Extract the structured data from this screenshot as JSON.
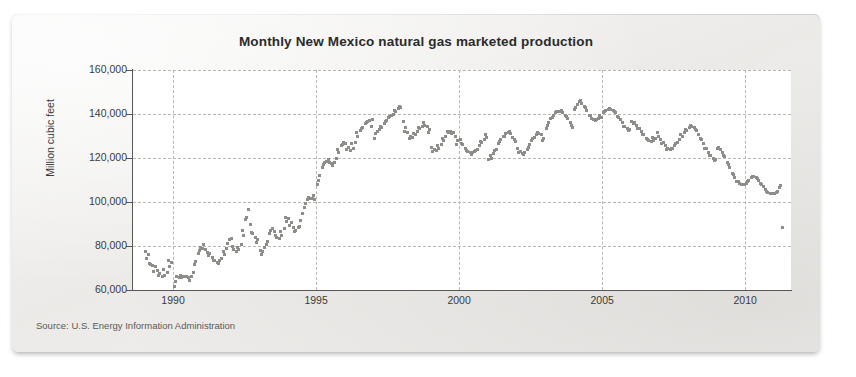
{
  "card": {
    "title": "Monthly New Mexico natural gas marketed production",
    "source_note": "Source: U.S. Energy Information Administration"
  },
  "colors": {
    "marker": "#8e8d8a",
    "axis": "#595754",
    "grid": "#b9b7b4",
    "plot_background": "#ffffff",
    "card_background": "#f1f0ee",
    "title_text": "#2b2b2b"
  },
  "chart_data": {
    "type": "scatter",
    "title": "Monthly New Mexico natural gas marketed production",
    "xlabel": "",
    "ylabel": "Million cubic feet",
    "xlim": [
      1988.6,
      2011.6
    ],
    "ylim": [
      60000,
      160000
    ],
    "grid": true,
    "legend": null,
    "ytick_labels": [
      "160,000",
      "140,000",
      "120,000",
      "100,000",
      "80,000",
      "60,000"
    ],
    "ytick_values": [
      160000,
      140000,
      120000,
      100000,
      80000,
      60000
    ],
    "xtick_labels": [
      "1990",
      "1995",
      "2000",
      "2005",
      "2010"
    ],
    "xtick_values": [
      1990,
      1995,
      2000,
      2005,
      2010
    ],
    "series": [
      {
        "name": "New Mexico marketed production",
        "marker": "square",
        "x": [
          1989.04,
          1989.13,
          1989.21,
          1989.29,
          1989.38,
          1989.46,
          1989.54,
          1989.63,
          1989.71,
          1989.79,
          1989.88,
          1989.96,
          1990.04,
          1990.13,
          1990.21,
          1990.29,
          1990.38,
          1990.46,
          1990.54,
          1990.63,
          1990.71,
          1990.79,
          1990.88,
          1990.96,
          1991.04,
          1991.13,
          1991.21,
          1991.29,
          1991.38,
          1991.46,
          1991.54,
          1991.63,
          1991.71,
          1991.79,
          1991.88,
          1991.96,
          1992.04,
          1992.13,
          1992.21,
          1992.29,
          1992.38,
          1992.46,
          1992.54,
          1992.63,
          1992.71,
          1992.79,
          1992.88,
          1992.96,
          1993.04,
          1993.13,
          1993.21,
          1993.29,
          1993.38,
          1993.46,
          1993.54,
          1993.63,
          1993.71,
          1993.79,
          1993.88,
          1993.96,
          1994.04,
          1994.13,
          1994.21,
          1994.29,
          1994.38,
          1994.46,
          1994.54,
          1994.63,
          1994.71,
          1994.79,
          1994.88,
          1994.96,
          1995.04,
          1995.13,
          1995.21,
          1995.29,
          1995.38,
          1995.46,
          1995.54,
          1995.63,
          1995.71,
          1995.79,
          1995.88,
          1995.96,
          1996.04,
          1996.13,
          1996.21,
          1996.29,
          1996.38,
          1996.46,
          1996.54,
          1996.63,
          1996.71,
          1996.79,
          1996.88,
          1996.96,
          1997.04,
          1997.13,
          1997.21,
          1997.29,
          1997.38,
          1997.46,
          1997.54,
          1997.63,
          1997.71,
          1997.79,
          1997.88,
          1997.96,
          1998.04,
          1998.13,
          1998.21,
          1998.29,
          1998.38,
          1998.46,
          1998.54,
          1998.63,
          1998.71,
          1998.79,
          1998.88,
          1998.96,
          1999.04,
          1999.13,
          1999.21,
          1999.29,
          1999.38,
          1999.46,
          1999.54,
          1999.63,
          1999.71,
          1999.79,
          1999.88,
          1999.96,
          2000.04,
          2000.13,
          2000.21,
          2000.29,
          2000.38,
          2000.46,
          2000.54,
          2000.63,
          2000.71,
          2000.79,
          2000.88,
          2000.96,
          2001.04,
          2001.13,
          2001.21,
          2001.29,
          2001.38,
          2001.46,
          2001.54,
          2001.63,
          2001.71,
          2001.79,
          2001.88,
          2001.96,
          2002.04,
          2002.13,
          2002.21,
          2002.29,
          2002.38,
          2002.46,
          2002.54,
          2002.63,
          2002.71,
          2002.79,
          2002.88,
          2002.96,
          2003.04,
          2003.13,
          2003.21,
          2003.29,
          2003.38,
          2003.46,
          2003.54,
          2003.63,
          2003.71,
          2003.79,
          2003.88,
          2003.96,
          2004.04,
          2004.13,
          2004.21,
          2004.29,
          2004.38,
          2004.46,
          2004.54,
          2004.63,
          2004.71,
          2004.79,
          2004.88,
          2004.96,
          2005.04,
          2005.13,
          2005.21,
          2005.29,
          2005.38,
          2005.46,
          2005.54,
          2005.63,
          2005.71,
          2005.79,
          2005.88,
          2005.96,
          2006.04,
          2006.13,
          2006.21,
          2006.29,
          2006.38,
          2006.46,
          2006.54,
          2006.63,
          2006.71,
          2006.79,
          2006.88,
          2006.96,
          2007.04,
          2007.13,
          2007.21,
          2007.29,
          2007.38,
          2007.46,
          2007.54,
          2007.63,
          2007.71,
          2007.79,
          2007.88,
          2007.96,
          2008.04,
          2008.13,
          2008.21,
          2008.29,
          2008.38,
          2008.46,
          2008.54,
          2008.63,
          2008.71,
          2008.79,
          2008.88,
          2008.96,
          2009.04,
          2009.13,
          2009.21,
          2009.29,
          2009.38,
          2009.46,
          2009.54,
          2009.63,
          2009.71,
          2009.79,
          2009.88,
          2009.96,
          2010.04,
          2010.13,
          2010.21,
          2010.29,
          2010.38,
          2010.46,
          2010.54,
          2010.63,
          2010.71,
          2010.79,
          2010.88,
          2010.96,
          2011.04,
          2011.13,
          2011.21,
          2011.29
        ],
        "y": [
          77500,
          76200,
          71500,
          71000,
          70500,
          69000,
          67500,
          66000,
          66500,
          68000,
          70500,
          72500,
          61500,
          66000,
          65500,
          65800,
          66200,
          66000,
          65500,
          66000,
          68000,
          73000,
          76500,
          79500,
          79000,
          78200,
          77000,
          76500,
          74800,
          73200,
          72500,
          73500,
          74500,
          76000,
          79000,
          83000,
          83500,
          78500,
          77500,
          78500,
          80500,
          85000,
          92000,
          96500,
          90000,
          85500,
          84000,
          83000,
          78000,
          77500,
          79500,
          82000,
          85500,
          88000,
          86500,
          84000,
          83500,
          85000,
          88000,
          91000,
          92500,
          90500,
          88500,
          87000,
          88500,
          91500,
          95000,
          99500,
          101000,
          101500,
          101500,
          101000,
          108000,
          112000,
          115500,
          118000,
          118500,
          118000,
          117500,
          118000,
          120000,
          122500,
          125500,
          127000,
          126500,
          125000,
          123500,
          124500,
          127000,
          130000,
          132500,
          134000,
          135500,
          136500,
          137000,
          137500,
          129000,
          132000,
          133000,
          134000,
          135500,
          137000,
          138500,
          139500,
          140000,
          141000,
          142500,
          143000,
          136500,
          134000,
          131500,
          130000,
          129500,
          130500,
          132000,
          133500,
          134500,
          135000,
          134500,
          133000,
          125000,
          124000,
          123500,
          124500,
          126000,
          128000,
          130000,
          131500,
          132000,
          131500,
          130000,
          128000,
          128500,
          126000,
          124500,
          123000,
          122500,
          122500,
          123000,
          124000,
          125500,
          127000,
          128500,
          129500,
          119500,
          120000,
          122000,
          124000,
          126500,
          128500,
          130000,
          131000,
          131500,
          131000,
          129500,
          127500,
          124500,
          123000,
          122000,
          122500,
          124000,
          126000,
          128000,
          129500,
          130500,
          131000,
          130500,
          129000,
          133500,
          136000,
          138000,
          139500,
          140500,
          141000,
          141000,
          140500,
          139500,
          138000,
          136000,
          134000,
          142000,
          144500,
          145500,
          145000,
          143500,
          141500,
          139500,
          138000,
          137500,
          137500,
          138000,
          138500,
          140500,
          141500,
          142000,
          142000,
          141500,
          140500,
          139000,
          137500,
          136000,
          134500,
          133500,
          133000,
          136500,
          136000,
          135000,
          133500,
          132000,
          130500,
          129000,
          128000,
          127500,
          128000,
          129000,
          130000,
          128500,
          127000,
          125500,
          124500,
          124000,
          124500,
          125500,
          127000,
          128500,
          130000,
          131500,
          132500,
          134000,
          134500,
          134000,
          132500,
          130500,
          128500,
          126500,
          124500,
          122500,
          121000,
          120000,
          119500,
          124500,
          124000,
          122500,
          120500,
          118000,
          115500,
          113000,
          111000,
          109500,
          108500,
          108000,
          108000,
          108500,
          110000,
          111000,
          111500,
          111000,
          110000,
          108500,
          107000,
          105500,
          104500,
          104000,
          104000,
          104000,
          105000,
          106500,
          88500
        ]
      }
    ],
    "scatter_extra_points": {
      "note": "dispersion points giving the cloud its monthly spread",
      "x": [
        1989.08,
        1989.17,
        1989.33,
        1989.5,
        1989.67,
        1989.83,
        1990.08,
        1990.25,
        1990.42,
        1990.58,
        1990.75,
        1990.92,
        1991.08,
        1991.25,
        1991.42,
        1991.58,
        1991.75,
        1991.92,
        1992.08,
        1992.25,
        1992.42,
        1992.58,
        1992.75,
        1992.92,
        1993.08,
        1993.25,
        1993.42,
        1993.58,
        1993.75,
        1993.92,
        1994.08,
        1994.25,
        1994.42,
        1994.58,
        1994.75,
        1994.92,
        1995.08,
        1995.25,
        1995.42,
        1995.58,
        1995.75,
        1995.92,
        1996.08,
        1996.25,
        1996.42,
        1996.58,
        1996.75,
        1996.92,
        1997.08,
        1997.25,
        1997.42,
        1997.58,
        1997.75,
        1997.92,
        1998.08,
        1998.25,
        1998.42,
        1998.58,
        1998.75,
        1998.92,
        1999.08,
        1999.25,
        1999.42,
        1999.58,
        1999.75,
        1999.92,
        2000.08,
        2000.25,
        2000.42,
        2000.58,
        2000.75,
        2000.92,
        2001.08,
        2001.25,
        2001.42,
        2001.58,
        2001.75,
        2001.92,
        2002.08,
        2002.25,
        2002.42,
        2002.58,
        2002.75,
        2002.92,
        2003.08,
        2003.25,
        2003.42,
        2003.58,
        2003.75,
        2003.92,
        2004.08,
        2004.25,
        2004.42,
        2004.58,
        2004.75,
        2004.92,
        2005.08,
        2005.25,
        2005.42,
        2005.58,
        2005.75,
        2005.92,
        2006.08,
        2006.25,
        2006.42,
        2006.58,
        2006.75,
        2006.92,
        2007.08,
        2007.25,
        2007.42,
        2007.58,
        2007.75,
        2007.92,
        2008.08,
        2008.25,
        2008.42,
        2008.58,
        2008.75,
        2008.92,
        2009.08,
        2009.25,
        2009.42,
        2009.58,
        2009.75,
        2009.92,
        2010.08,
        2010.25,
        2010.42,
        2010.58,
        2010.75,
        2010.92,
        2011.08,
        2011.25
      ],
      "y": [
        74500,
        72000,
        68500,
        66500,
        69500,
        73500,
        64000,
        66500,
        66000,
        64500,
        71500,
        78000,
        80500,
        75500,
        73500,
        72000,
        77500,
        81000,
        80000,
        79500,
        87000,
        93000,
        86000,
        81500,
        76000,
        80500,
        87000,
        85000,
        86500,
        93000,
        89500,
        86500,
        89000,
        97500,
        102000,
        103000,
        110000,
        117000,
        119500,
        116500,
        124000,
        126000,
        124000,
        126500,
        131500,
        133500,
        136000,
        134500,
        131000,
        134500,
        136500,
        139000,
        141500,
        143500,
        132000,
        129000,
        131000,
        134000,
        136000,
        131500,
        123000,
        125500,
        129000,
        132000,
        131000,
        126000,
        126500,
        123500,
        121500,
        123500,
        127500,
        130500,
        121000,
        123500,
        127500,
        130000,
        132000,
        128500,
        122500,
        121500,
        125000,
        129000,
        131500,
        128000,
        135000,
        138500,
        141000,
        141500,
        139000,
        135000,
        143000,
        146000,
        143000,
        139500,
        137000,
        139500,
        141000,
        142500,
        141000,
        138500,
        134500,
        132500,
        135500,
        133500,
        130500,
        128500,
        129500,
        131500,
        126500,
        124000,
        124500,
        126500,
        130500,
        133000,
        135000,
        133000,
        129000,
        124500,
        121000,
        119000,
        125000,
        121000,
        117000,
        112500,
        109500,
        108000,
        109500,
        111500,
        110500,
        108000,
        105000,
        104000,
        104500,
        107500
      ]
    }
  }
}
